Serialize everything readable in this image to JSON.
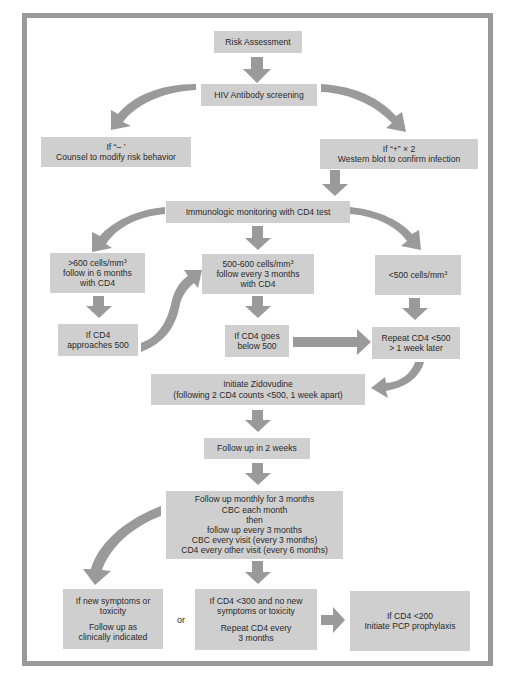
{
  "diagram": {
    "type": "flowchart",
    "colors": {
      "box_fill": "#cfcfcf",
      "arrow": "#9a9a9a",
      "frame": "#9a9a9a",
      "text": "#2a2a2a"
    },
    "nodes": {
      "risk": {
        "lines": [
          "Risk Assessment"
        ]
      },
      "hiv": {
        "lines": [
          "HIV Antibody screening"
        ]
      },
      "neg": {
        "lines": [
          "If “– ’",
          "Counsel to modify risk behavior"
        ]
      },
      "pos": {
        "lines": [
          "If “+” × 2",
          "Western blot to confirm infection"
        ]
      },
      "immuno": {
        "lines": [
          "Immunologic monitoring with CD4 test"
        ]
      },
      "gt600": {
        "line1": ">600 cells/mm",
        "sup": "3",
        "line2": "follow  in 6 months",
        "line3": "with CD4"
      },
      "mid": {
        "line1": "500-600 cells/mm",
        "sup": "3",
        "line2": "follow every 3 months",
        "line3": "with CD4"
      },
      "lt500": {
        "line1": "<500 cells/mm",
        "sup": "3"
      },
      "approach": {
        "lines": [
          "If CD4",
          "approaches 500"
        ]
      },
      "below": {
        "lines": [
          "If CD4 goes",
          "below 500"
        ]
      },
      "repeat": {
        "lines": [
          "Repeat CD4 <500",
          "> 1 week later"
        ]
      },
      "zido": {
        "lines": [
          "Initiate Zidovudine",
          "(following 2 CD4 counts <500, 1 week apart)"
        ]
      },
      "fu2": {
        "lines": [
          "Follow up in 2 weeks"
        ]
      },
      "monthly": {
        "lines": [
          "Follow up monthly for 3 months",
          "CBC each month",
          "then",
          "follow up every 3 months",
          "CBC every visit (every 3 months)",
          "CD4 every other visit (every 6 months)"
        ]
      },
      "symptoms": {
        "lines": [
          "If new symptoms or",
          "toxicity",
          "Follow up as",
          "clinically indicated"
        ]
      },
      "cd4_300": {
        "lines": [
          "If CD4 <300 and no new",
          "symptoms or toxicity",
          "Repeat CD4 every",
          "3 months"
        ]
      },
      "pcp": {
        "lines": [
          "If CD4 <200",
          "Initiate PCP prophylaxis"
        ]
      }
    },
    "or_label": "or",
    "edges": [
      [
        "risk",
        "hiv"
      ],
      [
        "hiv",
        "neg"
      ],
      [
        "hiv",
        "pos"
      ],
      [
        "pos",
        "immuno"
      ],
      [
        "immuno",
        "gt600"
      ],
      [
        "immuno",
        "mid"
      ],
      [
        "immuno",
        "lt500"
      ],
      [
        "gt600",
        "approach"
      ],
      [
        "approach",
        "mid"
      ],
      [
        "mid",
        "below"
      ],
      [
        "below",
        "repeat"
      ],
      [
        "lt500",
        "repeat"
      ],
      [
        "repeat",
        "zido"
      ],
      [
        "zido",
        "fu2"
      ],
      [
        "fu2",
        "monthly"
      ],
      [
        "monthly",
        "symptoms"
      ],
      [
        "monthly",
        "cd4_300"
      ],
      [
        "cd4_300",
        "pcp"
      ]
    ]
  }
}
